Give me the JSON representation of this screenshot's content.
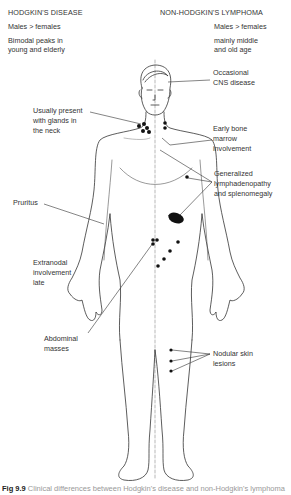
{
  "left_column": {
    "title": "HODGKIN'S DISEASE",
    "sex_ratio": "Males > females",
    "age_line1": "Bimodal peaks in",
    "age_line2": "young and elderly"
  },
  "right_column": {
    "title": "NON-HODGKIN'S LYMPHOMA",
    "sex_ratio": "Males > females",
    "age_line1": "mainly middle",
    "age_line2": "and old age"
  },
  "annotations": {
    "neck_line1": "Usually present",
    "neck_line2": "with glands in",
    "neck_line3": "the neck",
    "pruritus": "Pruritus",
    "extranodal_line1": "Extranodal",
    "extranodal_line2": "involvement",
    "extranodal_line3": "late",
    "abdominal_line1": "Abdominal",
    "abdominal_line2": "masses",
    "cns_line1": "Occasional",
    "cns_line2": "CNS disease",
    "bone_line1": "Early bone",
    "bone_line2": "marrow",
    "bone_line3": "involvement",
    "lymph_line1": "Generalized",
    "lymph_line2": "lymphadenopathy",
    "lymph_line3": "and splenomegaly",
    "skin_line1": "Nodular skin",
    "skin_line2": "lesions"
  },
  "caption": {
    "label": "Fig 9.9",
    "text": "Clinical differences between Hodgkin's disease and non-Hodgkin's lymphoma"
  }
}
